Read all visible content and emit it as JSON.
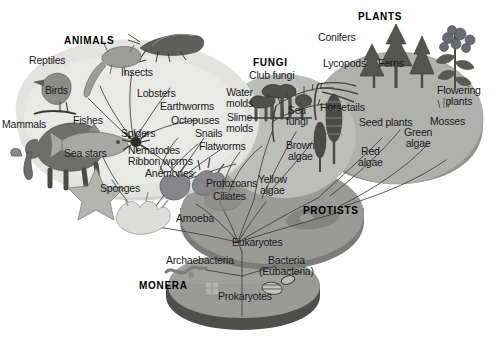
{
  "figure": {
    "type": "phylogenetic-tree-diagram",
    "title_text": ""
  },
  "kingdoms": [
    {
      "id": "animals",
      "label": "ANIMALS"
    },
    {
      "id": "fungi",
      "label": "FUNGI"
    },
    {
      "id": "plants",
      "label": "PLANTS"
    },
    {
      "id": "protists",
      "label": "PROTISTS"
    },
    {
      "id": "monera",
      "label": "MONERA"
    }
  ],
  "animals_labels": [
    {
      "id": "reptiles",
      "text": "Reptiles"
    },
    {
      "id": "birds",
      "text": "Birds"
    },
    {
      "id": "mammals",
      "text": "Mammals"
    },
    {
      "id": "fishes",
      "text": "Fishes"
    },
    {
      "id": "sea-stars",
      "text": "Sea stars"
    },
    {
      "id": "sponges",
      "text": "Sponges"
    },
    {
      "id": "insects",
      "text": "Insects"
    },
    {
      "id": "lobsters",
      "text": "Lobsters"
    },
    {
      "id": "earthworms",
      "text": "Earthworms"
    },
    {
      "id": "octopuses",
      "text": "Octopuses"
    },
    {
      "id": "snails",
      "text": "Snails"
    },
    {
      "id": "flatworms",
      "text": "Flatworms"
    },
    {
      "id": "spiders",
      "text": "Spiders"
    },
    {
      "id": "nematodes",
      "text": "Nematodes"
    },
    {
      "id": "ribbon-worms",
      "text": "Ribbon worms"
    },
    {
      "id": "anemones",
      "text": "Anemones"
    }
  ],
  "fungi_labels": [
    {
      "id": "club-fungi",
      "text": "Club fungi"
    },
    {
      "id": "water-molds",
      "text": "Water\nmolds"
    },
    {
      "id": "slime-molds",
      "text": "Slime\nmolds"
    },
    {
      "id": "sea-fungi",
      "text": "Sea\nfungi"
    },
    {
      "id": "brown-algae",
      "text": "Brown\nalgae"
    }
  ],
  "plants_labels": [
    {
      "id": "conifers",
      "text": "Conifers"
    },
    {
      "id": "lycopods",
      "text": "Lycopods"
    },
    {
      "id": "ferns",
      "text": "Ferns"
    },
    {
      "id": "flowering-plants",
      "text": "Flowering\nplants"
    },
    {
      "id": "horsetails",
      "text": "Horsetails"
    },
    {
      "id": "seed-plants",
      "text": "Seed plants"
    },
    {
      "id": "mosses",
      "text": "Mosses"
    },
    {
      "id": "green-algae",
      "text": "Green\nalgae"
    },
    {
      "id": "red-algae",
      "text": "Red\nalgae"
    }
  ],
  "protists_labels": [
    {
      "id": "protozoans",
      "text": "Protozoans"
    },
    {
      "id": "ciliates",
      "text": "Ciliates"
    },
    {
      "id": "yellow-algae",
      "text": "Yellow\nalgae"
    },
    {
      "id": "amoeba",
      "text": "Amoeba"
    },
    {
      "id": "eukaryotes",
      "text": "Eukaryotes"
    }
  ],
  "monera_labels": [
    {
      "id": "archaebacteria",
      "text": "Archaebacteria"
    },
    {
      "id": "bacteria",
      "text": "Bacteria\n(Eubacteria)"
    },
    {
      "id": "prokaryotes",
      "text": "Prokaryotes"
    }
  ],
  "illustrations": [
    {
      "id": "grasshopper-illustration",
      "for": "insects"
    },
    {
      "id": "lizard-illustration",
      "for": "reptiles"
    },
    {
      "id": "bird-illustration",
      "for": "birds"
    },
    {
      "id": "elephant-illustration",
      "for": "mammals"
    },
    {
      "id": "fish-illustration",
      "for": "fishes"
    },
    {
      "id": "starfish-illustration",
      "for": "sea-stars"
    },
    {
      "id": "sponge-illustration",
      "for": "sponges"
    },
    {
      "id": "lobster-illustration",
      "for": "lobsters"
    },
    {
      "id": "spider-illustration",
      "for": "spiders"
    },
    {
      "id": "anemone-illustration",
      "for": "anemones"
    },
    {
      "id": "mushroom-illustration",
      "for": "club-fungi"
    },
    {
      "id": "horsetail-illustration",
      "for": "horsetails"
    },
    {
      "id": "conifer-illustration",
      "for": "conifers"
    },
    {
      "id": "fern-illustration",
      "for": "ferns"
    },
    {
      "id": "flower-illustration",
      "for": "flowering-plants"
    },
    {
      "id": "amoeba-illustration",
      "for": "amoeba"
    },
    {
      "id": "archaebacterium-illustration",
      "for": "archaebacteria"
    },
    {
      "id": "bacteria-illustration",
      "for": "bacteria"
    }
  ],
  "colors": {
    "background": "#ffffff",
    "animals_lobe": "#e3e3e1",
    "animals_lobe_shadow": "#d2d2d0",
    "fungi_lobe": "#bdbdbb",
    "plants_lobe": "#b0b0ae",
    "protists_disk": "#9a9a98",
    "protists_disk_edge": "#7c7c7a",
    "monera_base": "#9a9a98",
    "monera_base_edge": "#4e4e4c",
    "line": "#3b3b3b",
    "text": "#1a1a1a"
  }
}
